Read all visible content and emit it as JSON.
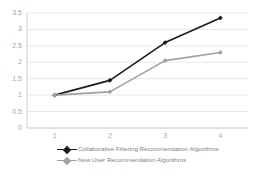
{
  "chart_data": {
    "type": "line",
    "title": "",
    "xlabel": "",
    "ylabel": "",
    "categories": [
      "1",
      "2",
      "3",
      "4"
    ],
    "ylim": [
      0,
      3.5
    ],
    "yticks": [
      "0",
      "0.5",
      "1",
      "1.5",
      "2",
      "2.5",
      "3",
      "3.5"
    ],
    "grid": true,
    "legend_position": "bottom-left",
    "series": [
      {
        "name": "Collaborative Filtering Recommendation Algorithms",
        "color": "#1a1a1a",
        "marker": "diamond",
        "values": [
          1.0,
          1.45,
          2.6,
          3.35
        ]
      },
      {
        "name": "New User Recommendation Algorithms",
        "color": "#a0a0a0",
        "marker": "diamond",
        "values": [
          1.0,
          1.1,
          2.05,
          2.3
        ]
      }
    ]
  },
  "axis": {
    "tick_color": "#a6a6a6",
    "grid_color": "#e8e8e8",
    "axis_color": "#d0d0d0"
  }
}
